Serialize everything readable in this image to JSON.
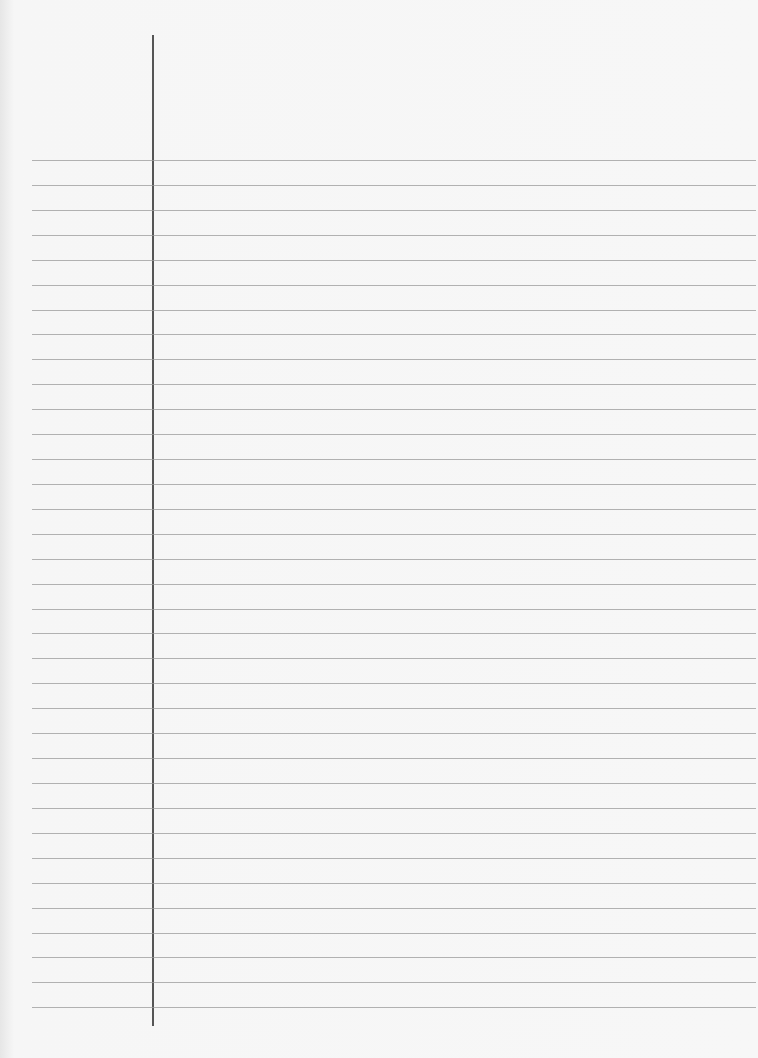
{
  "paper": {
    "type": "lined-notebook-page",
    "line_count": 35,
    "first_line_y": 160,
    "line_spacing": 25,
    "margin_line_x": 152,
    "line_color": "#9a9a9a",
    "margin_color": "#555555",
    "background": "#f7f7f7"
  }
}
